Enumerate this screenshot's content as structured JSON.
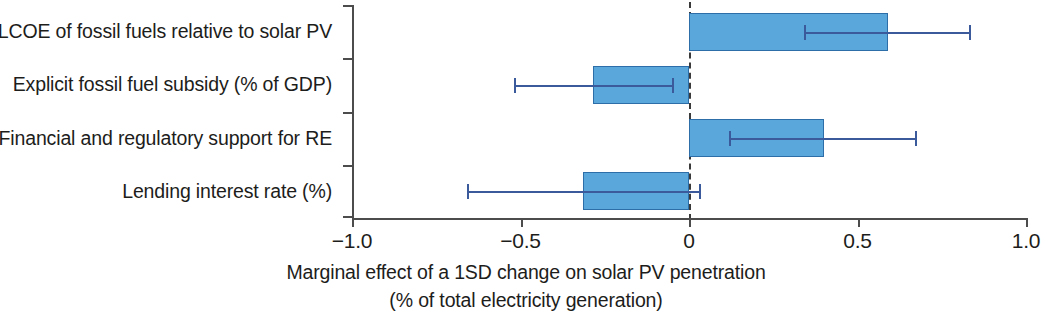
{
  "chart_data": {
    "type": "bar",
    "orientation": "horizontal",
    "title": "",
    "xlabel": "Marginal effect of a 1SD change on solar PV penetration (% of total electricity generation)",
    "xlabel_line1": "Marginal effect of a 1SD change on solar PV penetration",
    "xlabel_line2": "(% of total electricity generation)",
    "ylabel": "",
    "categories": [
      "LCOE of fossil fuels relative to solar PV",
      "Explicit fossil fuel subsidy (% of GDP)",
      "Financial and regulatory support for RE",
      "Lending interest rate (%)"
    ],
    "values": [
      0.59,
      -0.285,
      0.4,
      -0.315
    ],
    "ci_low": [
      0.34,
      -0.52,
      0.12,
      -0.66
    ],
    "ci_high": [
      0.83,
      -0.05,
      0.67,
      0.03
    ],
    "xlim": [
      -1.0,
      1.0
    ],
    "xticks": [
      -1.0,
      -0.5,
      0,
      0.5,
      1.0
    ],
    "xtick_labels": [
      "−1.0",
      "−0.5",
      "0",
      "0.5",
      "1.0"
    ],
    "grid": false,
    "legend": false,
    "zero_line": true,
    "error_bars": true,
    "bar_color": "#5aa7dc",
    "bar_edge_color": "#2e6ea8",
    "error_bar_color": "#3b5a9b",
    "axis_color": "#4c4c4c"
  }
}
